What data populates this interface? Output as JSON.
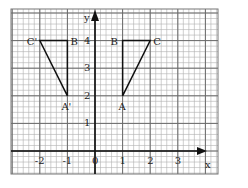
{
  "diagram": {
    "type": "coordinate-grid-reflection",
    "axes": {
      "x_label": "x",
      "y_label": "y",
      "origin_label": "0",
      "x_ticks": [
        "-2",
        "-1",
        "0",
        "1",
        "2",
        "3"
      ],
      "y_ticks": [
        "1",
        "2",
        "3",
        "4"
      ]
    },
    "triangle_original": {
      "vertices": [
        {
          "label": "A",
          "x": 1,
          "y": 2
        },
        {
          "label": "B",
          "x": 1,
          "y": 4
        },
        {
          "label": "C",
          "x": 2,
          "y": 4
        }
      ]
    },
    "triangle_image": {
      "vertices": [
        {
          "label": "A'",
          "x": -1,
          "y": 2
        },
        {
          "label": "B'",
          "x": -1,
          "y": 4
        },
        {
          "label": "C'",
          "x": -2,
          "y": 4
        }
      ]
    },
    "colors": {
      "grid": "#8a8a8a",
      "axis": "#111111",
      "triangle": "#111111"
    }
  }
}
